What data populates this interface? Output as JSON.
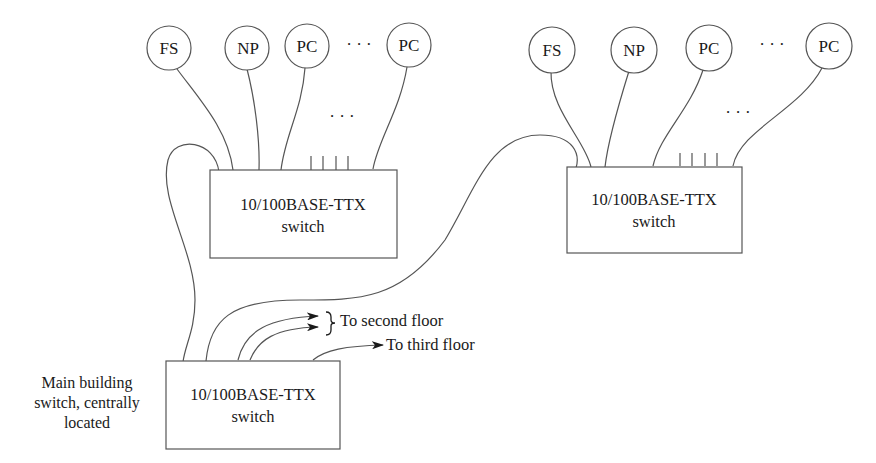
{
  "diagram": {
    "type": "network-topology",
    "left_cluster": {
      "nodes": [
        {
          "label": "FS"
        },
        {
          "label": "NP"
        },
        {
          "label": "PC"
        },
        {
          "label": "PC"
        }
      ],
      "ellipsis_between_nodes": "· · ·",
      "ellipsis_ports": "· · ·",
      "switch": {
        "line1": "10/100BASE-TTX",
        "line2": "switch"
      }
    },
    "right_cluster": {
      "nodes": [
        {
          "label": "FS"
        },
        {
          "label": "NP"
        },
        {
          "label": "PC"
        },
        {
          "label": "PC"
        }
      ],
      "ellipsis_between_nodes": "· · ·",
      "ellipsis_ports": "· · ·",
      "switch": {
        "line1": "10/100BASE-TTX",
        "line2": "switch"
      }
    },
    "main_switch": {
      "line1": "10/100BASE-TTX",
      "line2": "switch",
      "description_lines": [
        "Main building",
        "switch, centrally",
        "located"
      ]
    },
    "destinations": {
      "second_floor": "To second floor",
      "third_floor": "To third floor"
    }
  }
}
